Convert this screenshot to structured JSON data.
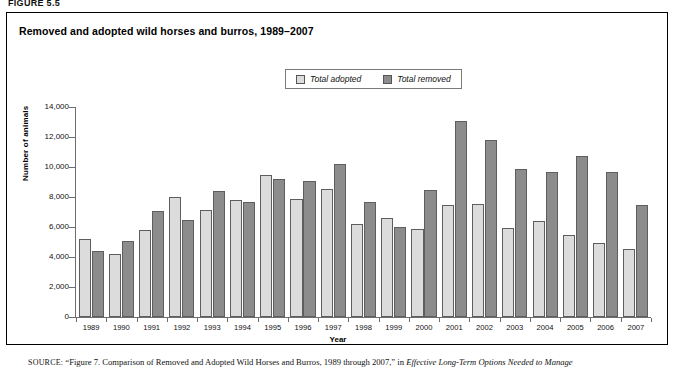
{
  "figure_label": "FIGURE 5.5",
  "chart_title": "Removed and adopted wild horses and burros, 1989–2007",
  "legend": {
    "items": [
      {
        "label": "Total adopted",
        "color": "#dcdcdc",
        "icon": "legend-swatch-icon"
      },
      {
        "label": "Total removed",
        "color": "#8c8c8c",
        "icon": "legend-swatch-icon"
      }
    ]
  },
  "source": {
    "prefix": "SOURCE:",
    "text": "“Figure 7. Comparison of Removed and Adopted Wild Horses and Burros, 1989 through 2007,” in ",
    "italic_text": "Effective Long-Term Options Needed to Manage"
  },
  "chart_data": {
    "type": "bar",
    "title": "Removed and adopted wild horses and burros, 1989–2007",
    "xlabel": "Year",
    "ylabel": "Number of animals",
    "ylim": [
      0,
      14000
    ],
    "yticks": [
      0,
      2000,
      4000,
      6000,
      8000,
      10000,
      12000,
      14000
    ],
    "ytick_labels": [
      "0",
      "2,000",
      "4,000",
      "6,000",
      "8,000",
      "10,000",
      "12,000",
      "14,000"
    ],
    "grid": false,
    "legend_position": "top-center",
    "categories": [
      "1989",
      "1990",
      "1991",
      "1992",
      "1993",
      "1994",
      "1995",
      "1996",
      "1997",
      "1998",
      "1999",
      "2000",
      "2001",
      "2002",
      "2003",
      "2004",
      "2005",
      "2006",
      "2007"
    ],
    "series": [
      {
        "name": "Total adopted",
        "color": "#dcdcdc",
        "values": [
          5200,
          4200,
          5800,
          8000,
          7150,
          7800,
          9500,
          7900,
          8550,
          6200,
          6600,
          5900,
          7450,
          7550,
          5950,
          6400,
          5500,
          4950,
          4550
        ]
      },
      {
        "name": "Total removed",
        "color": "#8c8c8c",
        "values": [
          4400,
          5050,
          7100,
          6500,
          8400,
          7700,
          9200,
          9100,
          10200,
          7700,
          6000,
          8450,
          13050,
          11800,
          9850,
          9650,
          10750,
          9650,
          7450
        ]
      }
    ]
  }
}
